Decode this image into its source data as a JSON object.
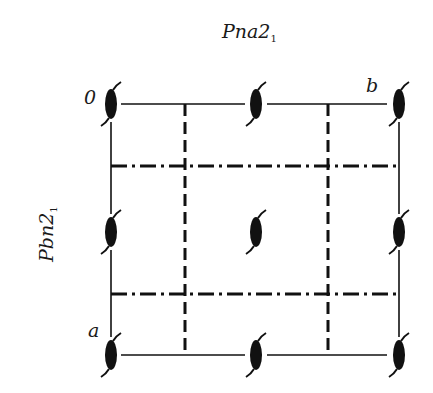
{
  "title": {
    "top": "Pna2",
    "top_sub": "1",
    "side": "Pbn2",
    "side_sub": "1"
  },
  "labels": {
    "origin": "0",
    "b_axis": "b",
    "a_axis": "a"
  },
  "colors": {
    "ink": "#111111",
    "background": "#ffffff"
  },
  "cell": {
    "x_left": 111,
    "x_right": 399,
    "y_top": 104,
    "y_bottom": 355
  },
  "symbols": {
    "type": "two-fold-screw-axis",
    "positions": [
      [
        111,
        104
      ],
      [
        256,
        104
      ],
      [
        399,
        104
      ],
      [
        111,
        232
      ],
      [
        256,
        232
      ],
      [
        399,
        232
      ],
      [
        111,
        355
      ],
      [
        256,
        355
      ],
      [
        399,
        355
      ]
    ]
  },
  "glide_planes": {
    "dashed_vertical_x": [
      185,
      328
    ],
    "dash_dot_horizontal_y": [
      166,
      294
    ]
  }
}
